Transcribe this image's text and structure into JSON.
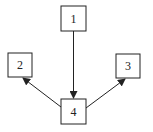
{
  "diagram": {
    "nodes": [
      {
        "id": "1",
        "label": "1",
        "x": 61,
        "y": 6,
        "w": 25,
        "h": 25
      },
      {
        "id": "2",
        "label": "2",
        "x": 8,
        "y": 53,
        "w": 24,
        "h": 24
      },
      {
        "id": "3",
        "label": "3",
        "x": 116,
        "y": 54,
        "w": 24,
        "h": 24
      },
      {
        "id": "4",
        "label": "4",
        "x": 61,
        "y": 99,
        "w": 25,
        "h": 25
      }
    ],
    "edges": [
      {
        "from": "1",
        "to": "4"
      },
      {
        "from": "4",
        "to": "2"
      },
      {
        "from": "4",
        "to": "3"
      }
    ],
    "colors": {
      "stroke": "#222222",
      "background": "#ffffff"
    }
  }
}
